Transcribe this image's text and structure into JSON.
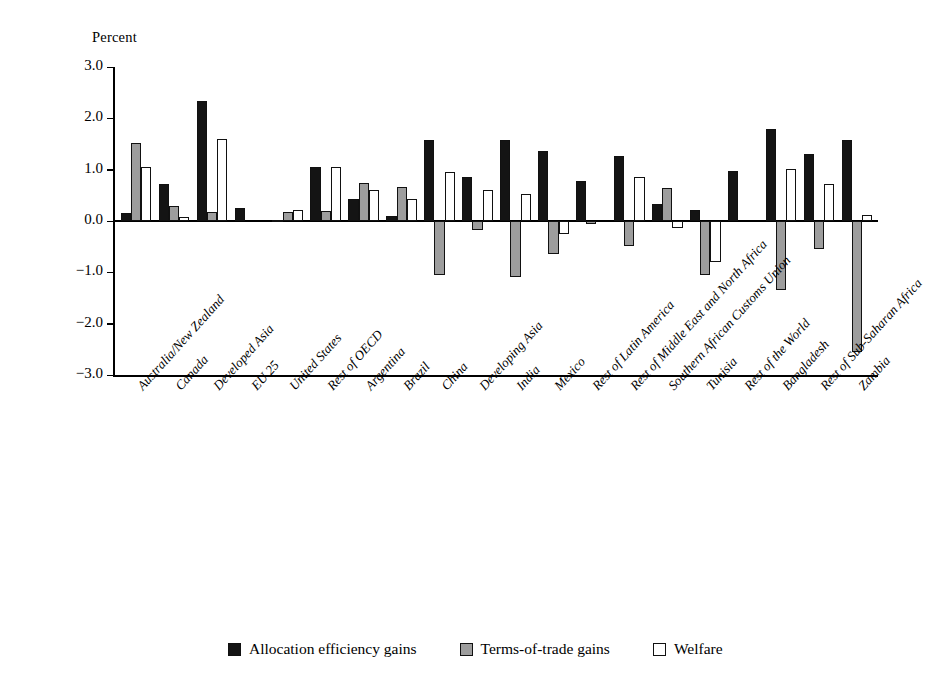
{
  "chart_data": {
    "type": "bar",
    "title": "",
    "xlabel": "",
    "ylabel": "Percent",
    "ylim": [
      -3.0,
      3.0
    ],
    "ytick_labels": [
      "3.0",
      "2.0",
      "1.0",
      "0.0",
      "−1.0",
      "−2.0",
      "−3.0"
    ],
    "ytick_values": [
      3.0,
      2.0,
      1.0,
      0.0,
      -1.0,
      -2.0,
      -3.0
    ],
    "grid": false,
    "legend_position": "bottom",
    "categories": [
      "Australia/New Zealand",
      "Canada",
      "Developed Asia",
      "EU 25",
      "United States",
      "Rest of OECD",
      "Argentina",
      "Brazil",
      "China",
      "Developing Asia",
      "India",
      "Mexico",
      "Rest of Latin America",
      "Rest of Middle East and North Africa",
      "Southern African Customs Union",
      "Tunisia",
      "Rest of the World",
      "Bangladesh",
      "Rest of Sub-Saharan Africa",
      "Zambia"
    ],
    "series": [
      {
        "name": "Allocation efficiency gains",
        "color": "#141414",
        "values": [
          0.15,
          0.72,
          2.33,
          0.26,
          0.02,
          1.05,
          0.42,
          0.1,
          1.58,
          0.85,
          1.58,
          1.37,
          0.78,
          1.27,
          0.33,
          0.22,
          0.98,
          1.79,
          1.3,
          1.58
        ]
      },
      {
        "name": "Terms-of-trade gains",
        "color": "#9d9d9d",
        "values": [
          1.52,
          0.3,
          0.18,
          0.0,
          0.17,
          0.2,
          0.75,
          0.66,
          -1.05,
          -0.18,
          -1.1,
          -0.65,
          -0.05,
          -0.48,
          0.65,
          -1.05,
          0.0,
          -1.35,
          -0.55,
          -2.55
        ]
      },
      {
        "name": "Welfare",
        "color": "#ffffff",
        "values": [
          1.06,
          0.08,
          1.6,
          0.0,
          0.21,
          1.06,
          0.6,
          0.43,
          0.95,
          0.6,
          0.53,
          -0.25,
          0.0,
          0.86,
          -0.13,
          -0.8,
          0.0,
          1.02,
          0.72,
          0.12
        ]
      }
    ]
  },
  "legend": {
    "items": [
      {
        "label": "Allocation efficiency gains"
      },
      {
        "label": "Terms-of-trade gains"
      },
      {
        "label": "Welfare"
      }
    ]
  }
}
